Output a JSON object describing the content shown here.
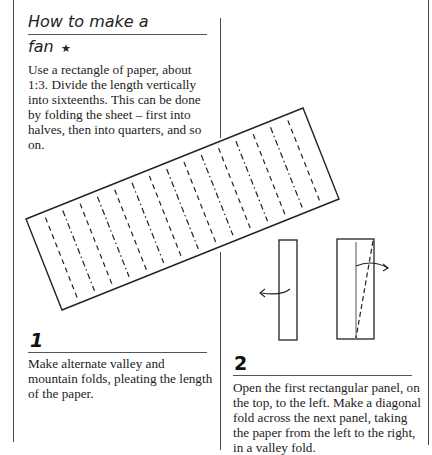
{
  "title": {
    "line1": "How to make a",
    "line2": "fan",
    "difficulty_icon": "star-icon",
    "difficulty_glyph": "★"
  },
  "intro": {
    "text": "Use a rectangle of paper, about 1:3. Divide the length vertically into sixteenths. This can be done by folding the sheet – first into halves, then into quarters, and so on."
  },
  "steps": [
    {
      "number": "1",
      "text": "Make alternate valley and mountain folds, pleating the length of the paper."
    },
    {
      "number": "2",
      "text": "Open the first rectangular panel, on the top, to the left. Make a diagonal fold across the next panel, taking the paper from the left to the right, in a valley fold."
    }
  ],
  "diagrams": {
    "step1": {
      "description": "Rotated rectangle divided into sixteenths with alternating mountain (dash-dot) and valley (dashed) fold lines",
      "divisions": 16
    },
    "step2": {
      "description": "Two folded panels: left panel with arrow opening to the left; right panel with diagonal dashed valley fold and arrow to the right"
    }
  },
  "colors": {
    "ink": "#1a1a1a",
    "rule": "#555555",
    "paper": "#ffffff"
  }
}
